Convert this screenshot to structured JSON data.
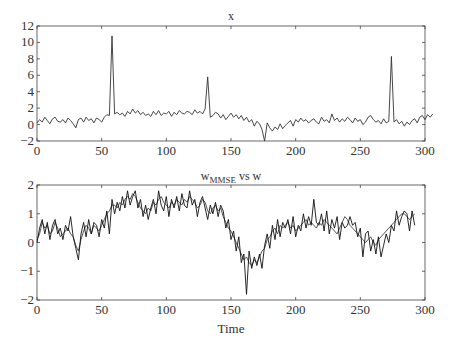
{
  "chart_data": [
    {
      "type": "line",
      "title": "x",
      "xlabel": "",
      "ylabel": "",
      "xlim": [
        0,
        300
      ],
      "ylim": [
        -2,
        12
      ],
      "xticks": [
        0,
        50,
        100,
        150,
        200,
        250,
        300
      ],
      "yticks": [
        -2,
        0,
        2,
        4,
        6,
        8,
        10,
        12
      ],
      "grid": false,
      "legend": null,
      "x_step": 2,
      "series": [
        {
          "name": "x",
          "color": "#333333",
          "values": [
            0.2,
            0.6,
            0.3,
            0.9,
            0.5,
            0.1,
            0.7,
            0.9,
            0.4,
            0.3,
            0.6,
            0.2,
            0.8,
            0.5,
            0.1,
            -0.4,
            0.6,
            0.8,
            0.3,
            0.9,
            0.5,
            0.7,
            0.2,
            0.8,
            0.6,
            0.3,
            0.9,
            1.2,
            1.1,
            10.8,
            1.3,
            1.5,
            1.2,
            1.4,
            1.0,
            1.6,
            1.3,
            1.9,
            1.4,
            1.7,
            1.2,
            1.5,
            1.1,
            1.3,
            1.0,
            1.6,
            1.2,
            1.7,
            1.1,
            1.4,
            1.3,
            1.6,
            1.0,
            1.5,
            1.2,
            1.7,
            1.4,
            1.3,
            1.6,
            1.5,
            1.2,
            1.8,
            1.4,
            1.6,
            1.3,
            1.9,
            5.8,
            0.9,
            1.1,
            1.5,
            1.3,
            0.8,
            1.2,
            0.6,
            1.0,
            1.4,
            0.9,
            1.2,
            0.7,
            1.1,
            0.5,
            0.9,
            0.3,
            0.6,
            -0.2,
            0.4,
            0.1,
            -0.6,
            -2.0,
            0.2,
            -0.4,
            -0.8,
            -0.3,
            -0.6,
            0.1,
            -0.5,
            -0.1,
            0.2,
            0.5,
            -0.2,
            0.6,
            0.3,
            0.8,
            0.4,
            0.6,
            0.2,
            0.5,
            0.7,
            0.3,
            0.1,
            0.9,
            0.4,
            0.6,
            0.2,
            1.3,
            0.5,
            0.8,
            0.3,
            0.7,
            0.4,
            0.9,
            0.6,
            0.2,
            0.8,
            0.4,
            0.6,
            0.0,
            0.3,
            0.9,
            1.1,
            0.6,
            0.3,
            0.5,
            0.1,
            0.7,
            0.2,
            0.4,
            8.3,
            0.3,
            0.6,
            0.1,
            0.4,
            -0.2,
            0.3,
            0.0,
            0.5,
            0.7,
            0.2,
            0.9,
            1.1,
            0.6,
            1.2,
            0.9,
            1.3
          ]
        }
      ]
    },
    {
      "type": "line",
      "title": "w_MMSE vs w",
      "xlabel": "Time",
      "ylabel": "",
      "xlim": [
        0,
        300
      ],
      "ylim": [
        -2,
        2
      ],
      "xticks": [
        0,
        50,
        100,
        150,
        200,
        250,
        300
      ],
      "yticks": [
        -2,
        -1,
        0,
        1,
        2
      ],
      "grid": false,
      "legend": null,
      "x_step": 2,
      "series": [
        {
          "name": "w",
          "color": "#555555",
          "values": [
            0.1,
            0.3,
            0.7,
            0.5,
            0.6,
            0.3,
            0.4,
            0.7,
            0.5,
            0.2,
            0.3,
            0.4,
            0.5,
            0.3,
            0.2,
            -0.1,
            -0.3,
            0.1,
            0.4,
            0.6,
            0.5,
            0.3,
            0.6,
            0.5,
            0.4,
            0.6,
            0.8,
            1.0,
            1.1,
            1.3,
            1.3,
            1.2,
            1.4,
            1.3,
            1.5,
            1.6,
            1.5,
            1.7,
            1.6,
            1.4,
            1.2,
            1.1,
            1.0,
            1.2,
            1.1,
            1.4,
            1.3,
            1.5,
            1.6,
            1.4,
            1.3,
            1.2,
            1.4,
            1.3,
            1.5,
            1.4,
            1.3,
            1.5,
            1.4,
            1.6,
            1.5,
            1.4,
            1.2,
            1.3,
            1.5,
            1.4,
            1.1,
            1.0,
            1.2,
            1.3,
            1.1,
            1.2,
            0.9,
            0.7,
            0.5,
            0.4,
            0.2,
            0.0,
            -0.2,
            -0.4,
            -0.6,
            -0.5,
            -0.7,
            -0.8,
            -0.6,
            -0.7,
            -0.5,
            -0.3,
            -0.2,
            0.1,
            0.2,
            0.4,
            0.5,
            0.3,
            0.6,
            0.5,
            0.6,
            0.7,
            0.5,
            0.6,
            0.4,
            0.5,
            0.6,
            0.7,
            0.8,
            0.6,
            0.7,
            0.6,
            0.5,
            0.7,
            0.6,
            0.8,
            0.7,
            0.6,
            0.5,
            0.4,
            0.3,
            0.5,
            0.7,
            0.9,
            0.8,
            0.6,
            0.5,
            0.4,
            0.3,
            0.2,
            0.1,
            0.0,
            0.1,
            0.2,
            0.0,
            -0.1,
            0.1,
            0.2,
            0.3,
            0.4,
            0.5,
            0.6,
            0.7,
            0.8,
            0.9,
            1.0,
            1.0,
            0.9,
            0.8,
            0.9,
            1.0
          ]
        },
        {
          "name": "w_MMSE",
          "color": "#111111",
          "values": [
            0.0,
            0.5,
            0.8,
            0.3,
            0.7,
            0.1,
            0.6,
            0.8,
            0.3,
            0.5,
            0.1,
            0.6,
            0.4,
            0.9,
            0.2,
            -0.2,
            -0.6,
            0.3,
            0.7,
            0.2,
            0.8,
            0.3,
            0.7,
            0.6,
            0.2,
            0.8,
            0.5,
            1.1,
            0.3,
            1.5,
            1.0,
            1.4,
            1.1,
            1.6,
            1.2,
            1.8,
            1.3,
            1.6,
            1.8,
            1.2,
            1.5,
            0.9,
            1.3,
            0.8,
            1.2,
            1.5,
            1.0,
            1.8,
            1.3,
            1.1,
            1.6,
            0.9,
            1.5,
            1.2,
            1.6,
            1.1,
            1.7,
            1.3,
            1.2,
            1.8,
            1.3,
            1.5,
            0.9,
            1.4,
            1.6,
            1.2,
            0.8,
            1.3,
            1.0,
            1.4,
            0.9,
            1.3,
            1.1,
            0.5,
            0.8,
            0.1,
            0.4,
            -0.3,
            0.2,
            -0.7,
            -0.4,
            -1.8,
            -0.3,
            -0.9,
            -0.5,
            -0.8,
            -0.4,
            -0.9,
            -0.1,
            0.3,
            -0.2,
            0.6,
            0.1,
            0.8,
            0.2,
            0.7,
            0.5,
            0.8,
            0.3,
            0.9,
            0.2,
            0.6,
            0.4,
            1.0,
            0.5,
            0.9,
            0.6,
            1.5,
            0.7,
            0.6,
            1.0,
            0.4,
            1.1,
            0.3,
            0.8,
            0.5,
            0.9,
            0.1,
            0.7,
            0.5,
            0.6,
            0.9,
            0.6,
            0.7,
            0.2,
            0.5,
            -0.5,
            0.3,
            0.4,
            -0.3,
            0.1,
            -0.4,
            0.2,
            -0.5,
            -0.1,
            0.3,
            0.0,
            0.6,
            0.4,
            1.1,
            0.6,
            0.9,
            1.1,
            1.0,
            0.4,
            1.1,
            0.6
          ]
        }
      ]
    }
  ],
  "plots": [
    {
      "title": "x"
    },
    {
      "title_main": "w",
      "title_sub": "MMSE",
      "title_rest": " vs w",
      "xlabel": "Time"
    }
  ]
}
